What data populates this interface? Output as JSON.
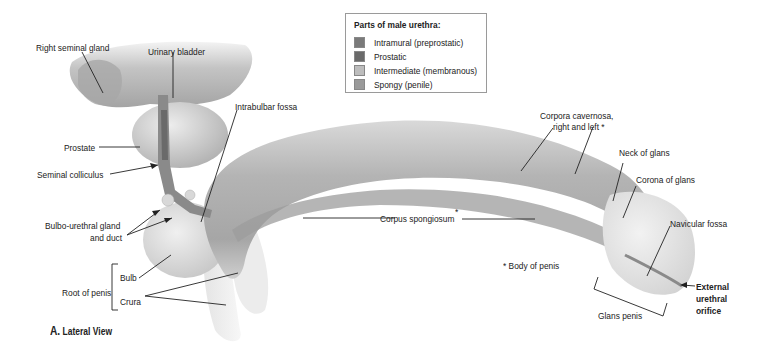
{
  "legend": {
    "title": "Parts of male urethra:",
    "items": [
      {
        "label": "Intramural (preprostatic)",
        "color": "#7a7a7a"
      },
      {
        "label": "Prostatic",
        "color": "#6a6a6a"
      },
      {
        "label": "Intermediate (membranous)",
        "color": "#bdbdbd"
      },
      {
        "label": "Spongy (penile)",
        "color": "#9a9a9a"
      }
    ]
  },
  "labels": {
    "right_seminal_gland": "Right seminal gland",
    "urinary_bladder": "Urinary bladder",
    "prostate": "Prostate",
    "seminal_colliculus": "Seminal colliculus",
    "intrabulbar_fossa": "Intrabulbar fossa",
    "bulbo_urethral_line1": "Bulbo-urethral gland",
    "bulbo_urethral_line2": "and duct",
    "root_of_penis": "Root of penis",
    "bulb": "Bulb",
    "crura": "Crura",
    "corpora_cavernosa_line1": "Corpora cavernosa,",
    "corpora_cavernosa_line2": "right and left  *",
    "neck_of_glans": "Neck of glans",
    "corona_of_glans": "Corona of glans",
    "corpus_spongiosum": "Corpus spongiosum",
    "corpus_spongiosum_star": "*",
    "navicular_fossa": "Navicular fossa",
    "body_of_penis": "*  Body of penis",
    "glans_penis": "Glans penis",
    "external_orifice_line1": "External",
    "external_orifice_line2": "urethral",
    "external_orifice_line3": "orifice"
  },
  "caption": {
    "letter": "A.",
    "text": "Lateral View"
  }
}
